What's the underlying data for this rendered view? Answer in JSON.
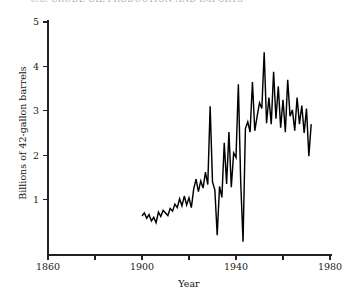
{
  "figure": {
    "title": "U.S. CRUDE OIL PRODUCTION AND IMPORTS",
    "width": 353,
    "height": 300,
    "background": "#ffffff",
    "line_color": "#000000",
    "axis_color": "#20202a"
  },
  "chart_data": {
    "type": "line",
    "title": "U.S. CRUDE OIL PRODUCTION AND IMPORTS",
    "xlabel": "Year",
    "ylabel": "Billions of 42-gallon barrels",
    "xlim": [
      1860,
      1980
    ],
    "ylim": [
      0,
      5
    ],
    "xticks": [
      1860,
      1880,
      1900,
      1920,
      1940,
      1960,
      1980
    ],
    "xticklabels": [
      "1860",
      "",
      "1900",
      "",
      "1940",
      "",
      "1980"
    ],
    "yticks": [
      1,
      2,
      3,
      4,
      5
    ],
    "yticklabels": [
      "1",
      "2",
      "3",
      "4",
      "5"
    ],
    "grid": false,
    "legend": null,
    "series": [
      {
        "name": "Crude oil",
        "x": [
          1900,
          1901,
          1902,
          1903,
          1904,
          1905,
          1906,
          1907,
          1908,
          1909,
          1910,
          1911,
          1912,
          1913,
          1914,
          1915,
          1916,
          1917,
          1918,
          1919,
          1920,
          1921,
          1922,
          1923,
          1924,
          1925,
          1926,
          1927,
          1928,
          1929,
          1930,
          1931,
          1932,
          1933,
          1934,
          1935,
          1936,
          1937,
          1938,
          1939,
          1940,
          1941,
          1942,
          1943,
          1944,
          1945,
          1946,
          1947,
          1948,
          1949,
          1950,
          1951,
          1952,
          1953,
          1954,
          1955,
          1956,
          1957,
          1958,
          1959,
          1960,
          1961,
          1962,
          1963,
          1964,
          1965,
          1966,
          1967,
          1968,
          1969,
          1970,
          1971,
          1972
        ],
        "values": [
          0.63,
          0.7,
          0.58,
          0.66,
          0.52,
          0.6,
          0.48,
          0.72,
          0.62,
          0.76,
          0.7,
          0.64,
          0.8,
          0.74,
          0.9,
          0.82,
          1.02,
          0.86,
          1.08,
          0.88,
          1.04,
          0.82,
          1.24,
          1.46,
          1.18,
          1.42,
          1.26,
          1.62,
          1.34,
          3.1,
          1.4,
          1.22,
          0.2,
          1.3,
          1.05,
          2.28,
          1.35,
          2.52,
          1.28,
          2.05,
          1.95,
          3.6,
          1.4,
          0.05,
          2.6,
          2.75,
          2.52,
          3.65,
          2.55,
          2.88,
          3.18,
          3.05,
          4.32,
          2.72,
          3.3,
          2.7,
          3.88,
          2.82,
          3.55,
          2.62,
          3.25,
          2.52,
          3.7,
          2.88,
          3.02,
          2.55,
          3.3,
          2.7,
          3.12,
          2.5,
          3.05,
          1.98,
          2.7
        ]
      }
    ]
  },
  "axes": {
    "y_title": "Billions of 42-gallon barrels",
    "x_title": "Year"
  }
}
